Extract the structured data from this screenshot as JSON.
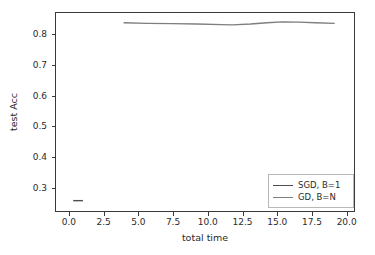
{
  "chart_data": {
    "type": "line",
    "title": "",
    "xlabel": "total time",
    "ylabel": "test Acc",
    "xlim": [
      -1.0,
      20.6
    ],
    "ylim": [
      0.222,
      0.872
    ],
    "grid": false,
    "legend_position": "lower right",
    "xticks": [
      "0.0",
      "2.5",
      "5.0",
      "7.5",
      "10.0",
      "12.5",
      "15.0",
      "17.5",
      "20.0"
    ],
    "xtick_values": [
      0.0,
      2.5,
      5.0,
      7.5,
      10.0,
      12.5,
      15.0,
      17.5,
      20.0
    ],
    "yticks": [
      "0.3",
      "0.4",
      "0.5",
      "0.6",
      "0.7",
      "0.8"
    ],
    "ytick_values": [
      0.3,
      0.4,
      0.5,
      0.6,
      0.7,
      0.8
    ],
    "series": [
      {
        "name": "SGD, B=1",
        "color": "#4d4d4d",
        "x": [
          0.25,
          0.95
        ],
        "y": [
          0.256,
          0.256
        ]
      },
      {
        "name": "GD, B=N",
        "color": "#7f7f7f",
        "x": [
          3.9,
          5.6,
          7.4,
          9.2,
          11.0,
          11.8,
          13.1,
          14.3,
          15.4,
          16.6,
          17.8,
          19.2
        ],
        "y": [
          0.84,
          0.838,
          0.837,
          0.836,
          0.834,
          0.833,
          0.836,
          0.84,
          0.843,
          0.842,
          0.84,
          0.838
        ]
      }
    ]
  },
  "legend": {
    "entries": [
      {
        "label": "SGD, B=1",
        "color": "#4d4d4d"
      },
      {
        "label": "GD, B=N",
        "color": "#7f7f7f"
      }
    ]
  },
  "axes": {
    "frame_color": "#3a3a3a"
  }
}
